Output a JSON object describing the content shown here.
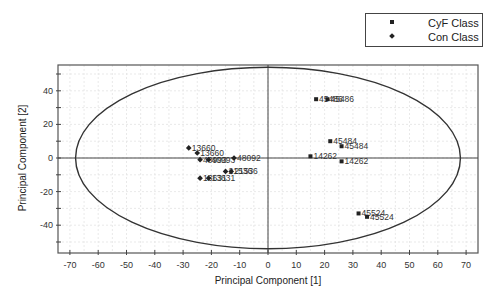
{
  "legend": {
    "items": [
      {
        "label": "CyF Class",
        "symbol": "square"
      },
      {
        "label": "Con Class",
        "symbol": "diamond"
      }
    ]
  },
  "chart_data": {
    "type": "scatter",
    "title": "",
    "xlabel": "Principal Component [1]",
    "ylabel": "Principal Component [2]",
    "xlim": [
      -74,
      74
    ],
    "ylim": [
      -55,
      55
    ],
    "xticks": [
      -70,
      -60,
      -50,
      -40,
      -30,
      -20,
      -10,
      0,
      10,
      20,
      30,
      40,
      50,
      60,
      70
    ],
    "yticks": [
      -40,
      -20,
      0,
      20,
      40
    ],
    "grid": true,
    "legend_position": "top-right, outside plot",
    "ellipse": {
      "cx": 0,
      "cy": 0,
      "rx": 68,
      "ry": 54
    },
    "series": [
      {
        "name": "CyF Class",
        "marker": "square",
        "points": [
          {
            "x": 17,
            "y": 35,
            "label": "45486"
          },
          {
            "x": 21,
            "y": 35,
            "label": "45486"
          },
          {
            "x": 22,
            "y": 10,
            "label": "45484"
          },
          {
            "x": 26,
            "y": 7,
            "label": "45484"
          },
          {
            "x": 15,
            "y": 1,
            "label": "14262"
          },
          {
            "x": 26,
            "y": -2,
            "label": "14262"
          },
          {
            "x": 32,
            "y": -33,
            "label": "45524"
          },
          {
            "x": 35,
            "y": -35,
            "label": "45524"
          }
        ]
      },
      {
        "name": "Con Class",
        "marker": "diamond",
        "points": [
          {
            "x": -28,
            "y": 6,
            "label": "13660"
          },
          {
            "x": -25,
            "y": 3,
            "label": "13660"
          },
          {
            "x": -24,
            "y": -1,
            "label": "40993"
          },
          {
            "x": -21,
            "y": -1,
            "label": "40993"
          },
          {
            "x": -12,
            "y": 0,
            "label": "48092"
          },
          {
            "x": -15,
            "y": -8,
            "label": "21536"
          },
          {
            "x": -13,
            "y": -8,
            "label": "21536"
          },
          {
            "x": -24,
            "y": -12,
            "label": "13631"
          },
          {
            "x": -21,
            "y": -12,
            "label": "13631"
          }
        ]
      }
    ]
  }
}
